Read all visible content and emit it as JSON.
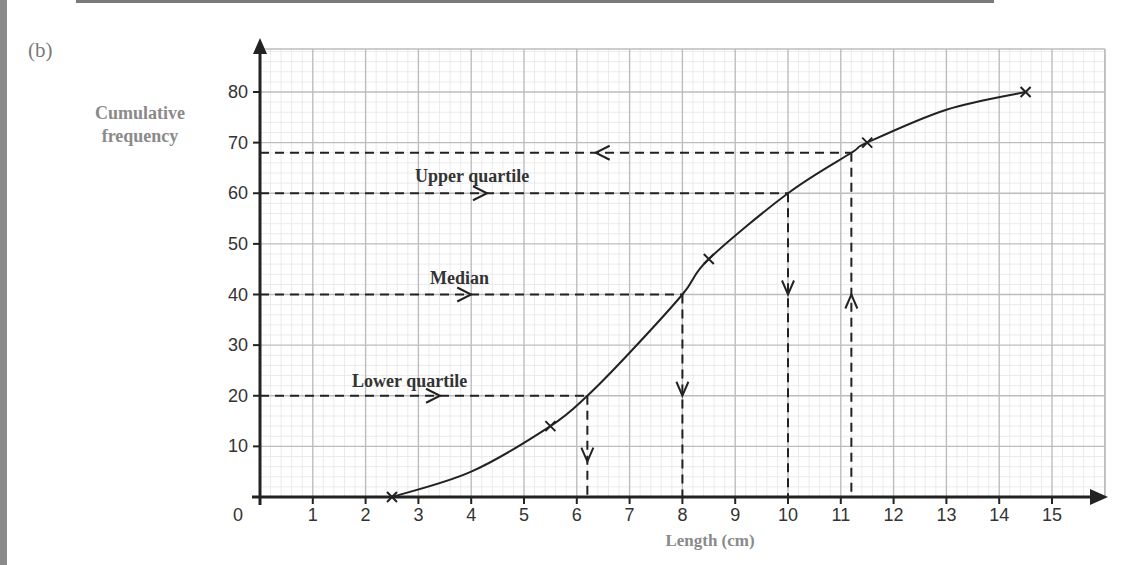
{
  "part_label": "(b)",
  "chart_data": {
    "type": "line",
    "title": "",
    "xlabel": "Length (cm)",
    "ylabel": "Cumulative frequency",
    "xlim": [
      0,
      15.5
    ],
    "ylim": [
      0,
      86
    ],
    "grid": true,
    "x_ticks": [
      0,
      1,
      2,
      3,
      4,
      5,
      6,
      7,
      8,
      9,
      10,
      11,
      12,
      13,
      14,
      15
    ],
    "y_ticks": [
      10,
      20,
      30,
      40,
      50,
      60,
      70,
      80
    ],
    "series": [
      {
        "name": "Cumulative frequency curve",
        "points": [
          [
            2.5,
            0
          ],
          [
            5.5,
            14
          ],
          [
            8.5,
            47
          ],
          [
            11.5,
            70
          ],
          [
            14.5,
            80
          ]
        ],
        "marker": "x"
      }
    ],
    "annotations": [
      {
        "label": "Lower quartile",
        "y": 20,
        "x": 6.2
      },
      {
        "label": "Median",
        "y": 40,
        "x": 8
      },
      {
        "label": "Upper quartile",
        "y": 60,
        "x": 10
      },
      {
        "label": "",
        "y": 68,
        "x": 11.2,
        "direction": "from x to y"
      }
    ]
  },
  "labels": {
    "ylabel_line1": "Cumulative",
    "ylabel_line2": "frequency",
    "xlabel": "Length (cm)",
    "origin": "0",
    "lower_quartile": "Lower quartile",
    "median": "Median",
    "upper_quartile": "Upper quartile"
  },
  "colors": {
    "axis": "#222222",
    "curve": "#222222",
    "grid_major": "#bdbdbd",
    "grid_minor": "#e6e6e6",
    "label_gray": "#8a8a8a"
  }
}
